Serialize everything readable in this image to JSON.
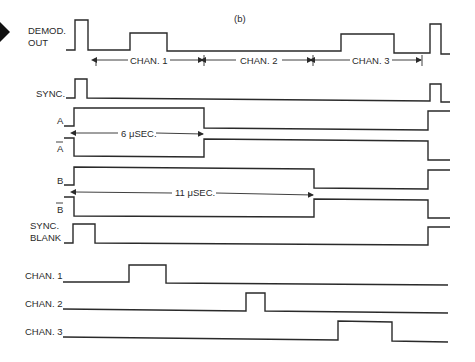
{
  "figure": {
    "panel_label": "(b)",
    "pointer_marker": "right-pointing black arrowhead"
  },
  "signals": [
    {
      "name": "demod_out",
      "label_line1": "DEMOD.",
      "label_line2": "OUT"
    },
    {
      "name": "sync",
      "label": "SYNC."
    },
    {
      "name": "a",
      "label": "A"
    },
    {
      "name": "a_bar",
      "label": "A",
      "overbar": true
    },
    {
      "name": "b",
      "label": "B"
    },
    {
      "name": "b_bar",
      "label": "B",
      "overbar": true
    },
    {
      "name": "sync_blank",
      "label_line1": "SYNC.",
      "label_line2": "BLANK"
    },
    {
      "name": "chan1",
      "label": "CHAN. 1"
    },
    {
      "name": "chan2",
      "label": "CHAN. 2"
    },
    {
      "name": "chan3",
      "label": "CHAN. 3"
    }
  ],
  "dimensions": {
    "chan1": "CHAN. 1",
    "chan2": "CHAN. 2",
    "chan3": "CHAN. 3",
    "a_width": "6 μSEC.",
    "b_width": "11 μSEC."
  }
}
